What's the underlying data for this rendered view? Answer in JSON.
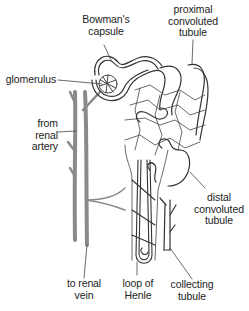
{
  "diagram": {
    "type": "anatomical-illustration",
    "labels": {
      "bowmans_capsule": "Bowman's\ncapsule",
      "proximal_tubule": "proximal\nconvoluted\ntubule",
      "glomerulus": "glomerulus",
      "renal_artery": "from\nrenal\nartery",
      "distal_tubule": "distal\nconvoluted\ntubule",
      "renal_vein": "to renal\nvein",
      "loop_of_henle": "loop of\nHenle",
      "collecting_tubule": "collecting\ntubule"
    },
    "colors": {
      "vessel": "#8a8a8a",
      "outline": "#333333",
      "leader_line": "#444444",
      "background": "#ffffff"
    }
  }
}
